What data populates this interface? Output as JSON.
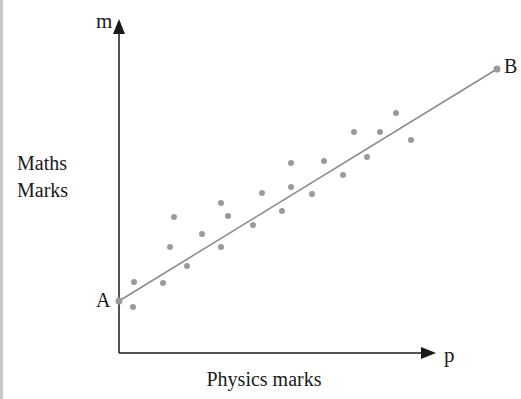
{
  "chart_data": {
    "type": "scatter",
    "title": "",
    "xlabel": "Physics marks",
    "ylabel": "Maths Marks",
    "x_axis_symbol": "p",
    "y_axis_symbol": "m",
    "grid": false,
    "legend": null,
    "ticks": "none",
    "line_of_best_fit": {
      "start_label": "A",
      "end_label": "B",
      "start": [
        0,
        52
      ],
      "end": [
        378,
        284
      ]
    },
    "points": [
      [
        15,
        71
      ],
      [
        14,
        46
      ],
      [
        44,
        70
      ],
      [
        51,
        106
      ],
      [
        55,
        136
      ],
      [
        68,
        87
      ],
      [
        83,
        119
      ],
      [
        102,
        150
      ],
      [
        109,
        137
      ],
      [
        102,
        106
      ],
      [
        134,
        128
      ],
      [
        143,
        160
      ],
      [
        163,
        142
      ],
      [
        172,
        190
      ],
      [
        172,
        166
      ],
      [
        193,
        159
      ],
      [
        205,
        192
      ],
      [
        224,
        178
      ],
      [
        235,
        221
      ],
      [
        248,
        196
      ],
      [
        261,
        221
      ],
      [
        277,
        240
      ],
      [
        292,
        213
      ]
    ],
    "colors": {
      "points": "#9a9a9a",
      "line": "#8a8a8a",
      "axes": "#1a1a1a"
    }
  },
  "labels": {
    "y_symbol": "m",
    "x_symbol": "p",
    "y_title_line1": "Maths",
    "y_title_line2": "Marks",
    "x_title": "Physics marks",
    "point_a": "A",
    "point_b": "B"
  }
}
